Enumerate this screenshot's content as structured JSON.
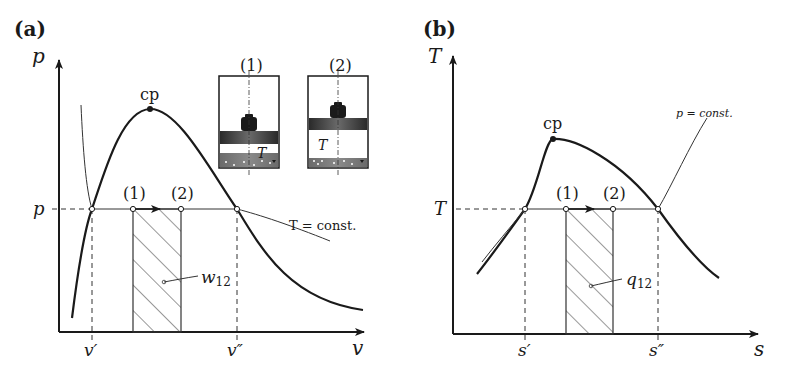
{
  "panel_a": {
    "label": "(a)",
    "y_axis_label": "p",
    "x_axis_label": "v",
    "p_level_label": "p",
    "v_prime_label": "v′",
    "v_double_prime_label": "v″",
    "critical_point_label": "cp",
    "state1_label": "(1)",
    "state2_label": "(2)",
    "isotherm_label": "T = const.",
    "area_label": "w",
    "area_subscript": "12",
    "inset1": {
      "title": "(1)",
      "temp_label": "T"
    },
    "inset2": {
      "title": "(2)",
      "temp_label": "T"
    }
  },
  "panel_b": {
    "label": "(b)",
    "y_axis_label": "T",
    "x_axis_label": "s",
    "t_level_label": "T",
    "s_prime_label": "s′",
    "s_double_prime_label": "s″",
    "critical_point_label": "cp",
    "state1_label": "(1)",
    "state2_label": "(2)",
    "isobar_label": "p = const.",
    "area_label": "q",
    "area_subscript": "12"
  },
  "colors": {
    "ink": "#1a1a1a",
    "thin_line": "#333333",
    "background": "#ffffff"
  }
}
